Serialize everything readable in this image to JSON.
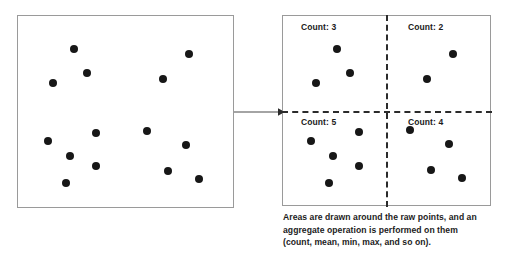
{
  "figure": {
    "point_color": "#171717",
    "panel_border_color": "#9a9a9a",
    "grid_color": "#2b2b2b"
  },
  "raw_panel": {
    "name": "raw points area",
    "point_count": 14,
    "points": [
      {
        "x": 56,
        "y": 33
      },
      {
        "x": 69,
        "y": 57
      },
      {
        "x": 35,
        "y": 67
      },
      {
        "x": 171,
        "y": 38
      },
      {
        "x": 145,
        "y": 63
      },
      {
        "x": 78,
        "y": 117
      },
      {
        "x": 30,
        "y": 125
      },
      {
        "x": 52,
        "y": 140
      },
      {
        "x": 78,
        "y": 150
      },
      {
        "x": 48,
        "y": 167
      },
      {
        "x": 129,
        "y": 115
      },
      {
        "x": 168,
        "y": 129
      },
      {
        "x": 150,
        "y": 155
      },
      {
        "x": 181,
        "y": 163
      }
    ]
  },
  "binned_panel": {
    "name": "binned aggregate area",
    "quadrants": [
      {
        "id": "top-left",
        "label": "Count: 3",
        "count": 3,
        "points": [
          {
            "x": 54,
            "y": 33
          },
          {
            "x": 67,
            "y": 57
          },
          {
            "x": 33,
            "y": 67
          }
        ]
      },
      {
        "id": "top-right",
        "label": "Count: 2",
        "count": 2,
        "points": [
          {
            "x": 170,
            "y": 38
          },
          {
            "x": 144,
            "y": 63
          }
        ]
      },
      {
        "id": "bottom-left",
        "label": "Count: 5",
        "count": 5,
        "points": [
          {
            "x": 76,
            "y": 116
          },
          {
            "x": 28,
            "y": 125
          },
          {
            "x": 50,
            "y": 140
          },
          {
            "x": 76,
            "y": 150
          },
          {
            "x": 46,
            "y": 167
          }
        ]
      },
      {
        "id": "bottom-right",
        "label": "Count: 4",
        "count": 4,
        "points": [
          {
            "x": 127,
            "y": 114
          },
          {
            "x": 166,
            "y": 128
          },
          {
            "x": 148,
            "y": 154
          },
          {
            "x": 179,
            "y": 162
          }
        ]
      }
    ]
  },
  "arrow": {
    "name": "transform arrow",
    "direction": "left-to-right"
  },
  "caption": {
    "line1": "Areas are drawn around the raw points, and an",
    "line2": "aggregate operation is performed on them",
    "line3": "(count, mean, min, max, and so on)."
  },
  "chart_data": {
    "type": "scatter",
    "title": "",
    "xlabel": "",
    "ylabel": "",
    "categories": [
      "Count: 3",
      "Count: 2",
      "Count: 5",
      "Count: 4"
    ],
    "values": [
      3,
      2,
      5,
      4
    ],
    "total_points": 14,
    "grid": true,
    "legend": "none"
  }
}
